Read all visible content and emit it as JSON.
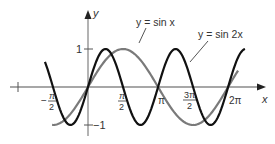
{
  "figure": {
    "axes": {
      "x_label": "x",
      "y_label": "y",
      "x_ticks": [
        {
          "value": "-π",
          "label": ""
        },
        {
          "value": "-π/2",
          "num": "π",
          "den": "2",
          "sign": "−"
        },
        {
          "value": "π/2",
          "num": "π",
          "den": "2",
          "sign": ""
        },
        {
          "value": "π",
          "label": "π"
        },
        {
          "value": "3π/2",
          "num": "3π",
          "den": "2",
          "sign": ""
        },
        {
          "value": "2π",
          "label": "2π"
        }
      ],
      "y_ticks": [
        {
          "value": 1,
          "label": "1"
        },
        {
          "value": -1,
          "label": "−1"
        }
      ]
    },
    "legend": {
      "sin_x": "y = sin x",
      "sin_2x": "y = sin 2x"
    },
    "colors": {
      "sin_x": "#7a7a7a",
      "sin_2x": "#111111",
      "axes": "#8a8a8a"
    }
  },
  "chart_data": {
    "type": "line",
    "title": "",
    "xlabel": "x",
    "ylabel": "y",
    "xlim": [
      -3.14159,
      6.9
    ],
    "ylim": [
      -1.2,
      1.3
    ],
    "grid": false,
    "series": [
      {
        "name": "y = sin x",
        "function": "sin(x)",
        "x_range": [
          -1.61,
          6.73
        ],
        "color": "#7a7a7a"
      },
      {
        "name": "y = sin 2x",
        "function": "sin(2x)",
        "x_range": [
          -1.93,
          7.04
        ],
        "color": "#111111"
      }
    ],
    "x_tick_labels": [
      "-π/2",
      "π/2",
      "π",
      "3π/2",
      "2π"
    ],
    "y_tick_labels": [
      "1",
      "-1"
    ]
  }
}
